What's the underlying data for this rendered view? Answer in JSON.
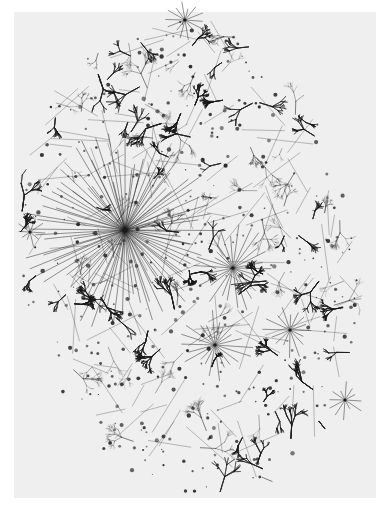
{
  "image": {
    "kind": "network-graph-visualization",
    "description": "Dense monochrome tree-like network map forming an oval cloud, with a prominent radial hub on the left-center",
    "background_color": "#ffffff",
    "panel_color": "#efefef",
    "ink_color": "#1a1a1a",
    "panel": {
      "x": 14,
      "y": 12,
      "width": 362,
      "height": 486
    },
    "cloud": {
      "cx": 190,
      "cy": 258,
      "rx": 172,
      "ry": 244,
      "tilt_deg": -8
    },
    "hubs": [
      {
        "x": 125,
        "y": 230,
        "spokes": 90,
        "length": 95,
        "label": "major-hub"
      },
      {
        "x": 233,
        "y": 268,
        "spokes": 26,
        "length": 40,
        "label": "hub"
      },
      {
        "x": 215,
        "y": 345,
        "spokes": 22,
        "length": 35,
        "label": "hub"
      },
      {
        "x": 185,
        "y": 20,
        "spokes": 14,
        "length": 18,
        "label": "hub"
      },
      {
        "x": 290,
        "y": 330,
        "spokes": 16,
        "length": 28,
        "label": "hub"
      },
      {
        "x": 345,
        "y": 400,
        "spokes": 12,
        "length": 18,
        "label": "hub"
      },
      {
        "x": 30,
        "y": 232,
        "spokes": 10,
        "length": 15,
        "label": "hub"
      }
    ],
    "node_count_estimate": 2600
  }
}
